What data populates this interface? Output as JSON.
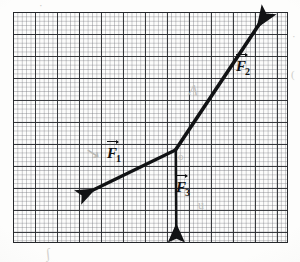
{
  "figure": {
    "kind": "hand-drawn force vector diagram on graph paper",
    "title": "",
    "background_color": "#fdfdfc",
    "ink_color": "#111214"
  },
  "grid": {
    "name": "graph-paper",
    "left": 13,
    "top": 12,
    "width": 275,
    "height": 231,
    "minor_cell_px": 4.4,
    "major_cell_px": 22,
    "minor_color": "#6e7076",
    "major_color": "#2a2c30",
    "border_color": "#26282c",
    "columns_major": 12,
    "rows_major": 10
  },
  "vectors": {
    "origin": {
      "x": 175,
      "y": 150
    },
    "items": [
      {
        "id": "F1",
        "label_letter": "F",
        "label_subscript": "1",
        "label_full": "F⃗1",
        "direction": "down-left",
        "from_x": 175,
        "from_y": 150,
        "to_x": 84,
        "to_y": 194,
        "label_x": 107,
        "label_y": 145,
        "stroke_width": 3.2,
        "color": "#111214"
      },
      {
        "id": "F2",
        "label_letter": "F",
        "label_subscript": "2",
        "label_full": "F⃗2",
        "direction": "up-right",
        "from_x": 175,
        "from_y": 150,
        "to_x": 266,
        "to_y": 14,
        "label_x": 236,
        "label_y": 58,
        "stroke_width": 3.6,
        "color": "#111214"
      },
      {
        "id": "F3",
        "label_letter": "F",
        "label_subscript": "3",
        "label_full": "F⃗3",
        "direction": "down",
        "from_x": 175,
        "from_y": 150,
        "to_x": 176,
        "to_y": 242,
        "label_x": 176,
        "label_y": 179,
        "stroke_width": 2.6,
        "color": "#111214"
      }
    ]
  },
  "annotations": {
    "pencil_marks": [
      {
        "id": "scribble-near-f1",
        "text": "↘",
        "x": 86,
        "y": 143
      },
      {
        "id": "letter-a-middle",
        "text": "A",
        "x": 188,
        "y": 82
      },
      {
        "id": "mark-at-junction",
        "text": "o",
        "x": 178,
        "y": 150
      },
      {
        "id": "letter-u-lower",
        "text": "u",
        "x": 198,
        "y": 198
      },
      {
        "id": "tick-above-grid",
        "text": "·",
        "x": 39,
        "y": -1
      },
      {
        "id": "scrawl-below-grid",
        "text": "∫",
        "x": 46,
        "y": 246
      },
      {
        "id": "right-margin-mark",
        "text": "·",
        "x": 292,
        "y": 30
      },
      {
        "id": "right-margin-mark-2",
        "text": "(",
        "x": 291,
        "y": 68
      }
    ]
  }
}
